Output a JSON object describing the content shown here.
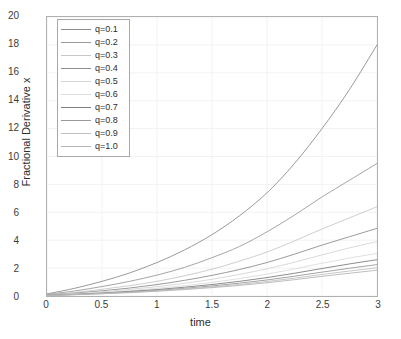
{
  "chart_data": {
    "type": "line",
    "title": "",
    "xlabel": "time",
    "ylabel": "Fractional Derivative x",
    "xlim": [
      0,
      3
    ],
    "ylim": [
      0,
      20
    ],
    "xticks": [
      "0",
      "0.5",
      "1",
      "1.5",
      "2",
      "2.5",
      "3"
    ],
    "xtick_values": [
      0,
      0.5,
      1,
      1.5,
      2,
      2.5,
      3
    ],
    "yticks": [
      "0",
      "2",
      "4",
      "6",
      "8",
      "10",
      "12",
      "14",
      "16",
      "18",
      "20"
    ],
    "ytick_values": [
      0,
      2,
      4,
      6,
      8,
      10,
      12,
      14,
      16,
      18,
      20
    ],
    "grid": true,
    "legend_position": "upper left",
    "x": [
      0,
      0.25,
      0.5,
      0.75,
      1,
      1.25,
      1.5,
      1.75,
      2,
      2.25,
      2.5,
      2.75,
      3
    ],
    "series": [
      {
        "name": "q=0.1",
        "color": "#8c8c8c",
        "values": [
          0.15,
          0.55,
          1.05,
          1.65,
          2.4,
          3.3,
          4.4,
          5.75,
          7.4,
          9.5,
          12.0,
          14.8,
          18.0
        ]
      },
      {
        "name": "q=0.2",
        "color": "#9a9a9a",
        "values": [
          0.12,
          0.36,
          0.68,
          1.05,
          1.5,
          2.05,
          2.75,
          3.55,
          4.6,
          5.8,
          7.1,
          8.3,
          9.5
        ]
      },
      {
        "name": "q=0.3",
        "color": "#c8c8c8",
        "values": [
          0.1,
          0.26,
          0.48,
          0.74,
          1.05,
          1.45,
          1.92,
          2.5,
          3.15,
          3.95,
          4.8,
          5.6,
          6.4
        ]
      },
      {
        "name": "q=0.4",
        "color": "#8f8f8f",
        "values": [
          0.08,
          0.2,
          0.37,
          0.57,
          0.82,
          1.12,
          1.48,
          1.9,
          2.4,
          3.0,
          3.65,
          4.25,
          4.85
        ]
      },
      {
        "name": "q=0.5",
        "color": "#d4d4d4",
        "values": [
          0.07,
          0.17,
          0.3,
          0.47,
          0.67,
          0.91,
          1.2,
          1.55,
          1.95,
          2.42,
          2.95,
          3.45,
          3.9
        ]
      },
      {
        "name": "q=0.6",
        "color": "#dcdcdc",
        "values": [
          0.06,
          0.14,
          0.25,
          0.38,
          0.55,
          0.74,
          0.97,
          1.25,
          1.57,
          1.94,
          2.35,
          2.72,
          3.05
        ]
      },
      {
        "name": "q=0.7",
        "color": "#7e7e7e",
        "values": [
          0.05,
          0.12,
          0.21,
          0.33,
          0.46,
          0.63,
          0.82,
          1.05,
          1.32,
          1.63,
          1.97,
          2.3,
          2.6
        ]
      },
      {
        "name": "q=0.8",
        "color": "#999999",
        "values": [
          0.05,
          0.11,
          0.19,
          0.29,
          0.41,
          0.55,
          0.72,
          0.92,
          1.15,
          1.42,
          1.71,
          1.99,
          2.25
        ]
      },
      {
        "name": "q=0.9",
        "color": "#c0c0c0",
        "values": [
          0.04,
          0.1,
          0.17,
          0.26,
          0.37,
          0.5,
          0.65,
          0.83,
          1.04,
          1.28,
          1.54,
          1.79,
          2.02
        ]
      },
      {
        "name": "q=1.0",
        "color": "#b5b5b5",
        "values": [
          0.04,
          0.09,
          0.16,
          0.24,
          0.34,
          0.46,
          0.6,
          0.76,
          0.95,
          1.17,
          1.41,
          1.63,
          1.85
        ]
      }
    ]
  },
  "axis": {
    "x_label": "time",
    "y_label": "Fractional Derivative x"
  },
  "legend": {
    "entries": [
      {
        "label": "q=0.1"
      },
      {
        "label": "q=0.2"
      },
      {
        "label": "q=0.3"
      },
      {
        "label": "q=0.4"
      },
      {
        "label": "q=0.5"
      },
      {
        "label": "q=0.6"
      },
      {
        "label": "q=0.7"
      },
      {
        "label": "q=0.8"
      },
      {
        "label": "q=0.9"
      },
      {
        "label": "q=1.0"
      }
    ]
  },
  "style": {
    "background": "#ffffff",
    "axis_color": "#b0b0b0",
    "grid_color": "#f2f2f2",
    "text_color": "#3b3b3b"
  }
}
